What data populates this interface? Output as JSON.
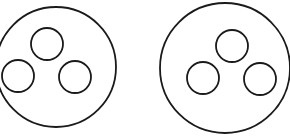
{
  "figure": {
    "stroke_color": "#1a1a1a",
    "background": "#ffffff",
    "groups": [
      {
        "name": "left",
        "outer": {
          "cx": 56,
          "cy": 67,
          "r": 60
        },
        "inner": [
          {
            "cx": 47,
            "cy": 44,
            "r": 16
          },
          {
            "cx": 18,
            "cy": 76,
            "r": 16
          },
          {
            "cx": 75,
            "cy": 77,
            "r": 16
          }
        ]
      },
      {
        "name": "right",
        "outer": {
          "cx": 225,
          "cy": 68,
          "r": 65
        },
        "inner": [
          {
            "cx": 232,
            "cy": 46,
            "r": 16
          },
          {
            "cx": 203,
            "cy": 78,
            "r": 16
          },
          {
            "cx": 260,
            "cy": 79,
            "r": 16
          }
        ]
      }
    ]
  }
}
